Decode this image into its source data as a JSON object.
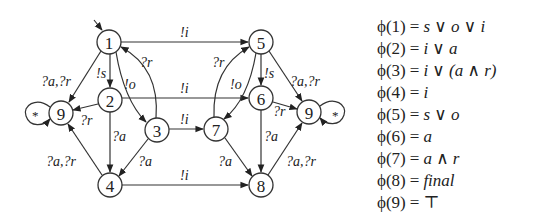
{
  "diagram": {
    "nodes": [
      {
        "id": "1",
        "label": "1",
        "x": 109,
        "y": 42
      },
      {
        "id": "2",
        "label": "2",
        "x": 110,
        "y": 100
      },
      {
        "id": "3",
        "label": "3",
        "x": 157,
        "y": 130
      },
      {
        "id": "4",
        "label": "4",
        "x": 110,
        "y": 185
      },
      {
        "id": "5",
        "label": "5",
        "x": 261,
        "y": 42
      },
      {
        "id": "6",
        "label": "6",
        "x": 261,
        "y": 98
      },
      {
        "id": "7",
        "label": "7",
        "x": 216,
        "y": 129
      },
      {
        "id": "8",
        "label": "8",
        "x": 261,
        "y": 185
      },
      {
        "id": "9L",
        "label": "9",
        "x": 61,
        "y": 113
      },
      {
        "id": "9R",
        "label": "9",
        "x": 309,
        "y": 112
      }
    ],
    "edges": [
      {
        "from": "start",
        "to": "1",
        "label": ""
      },
      {
        "from": "1",
        "to": "5",
        "label": "!i"
      },
      {
        "from": "2",
        "to": "6",
        "label": "!i"
      },
      {
        "from": "3",
        "to": "7",
        "label": "!i"
      },
      {
        "from": "4",
        "to": "8",
        "label": "!i"
      },
      {
        "from": "1",
        "to": "2",
        "label": "!s"
      },
      {
        "from": "1",
        "to": "3",
        "label": "!o"
      },
      {
        "from": "3",
        "to": "1",
        "label": "?r"
      },
      {
        "from": "1",
        "to": "9L",
        "label": "?a,?r"
      },
      {
        "from": "2",
        "to": "9L",
        "label": "?r"
      },
      {
        "from": "2",
        "to": "4",
        "label": "?a"
      },
      {
        "from": "3",
        "to": "4",
        "label": "?a"
      },
      {
        "from": "4",
        "to": "9L",
        "label": "?a,?r"
      },
      {
        "from": "9L",
        "to": "9L",
        "label": "*"
      },
      {
        "from": "5",
        "to": "6",
        "label": "!s"
      },
      {
        "from": "5",
        "to": "7",
        "label": "!o"
      },
      {
        "from": "7",
        "to": "5",
        "label": "?r"
      },
      {
        "from": "5",
        "to": "9R",
        "label": "?a,?r"
      },
      {
        "from": "6",
        "to": "9R",
        "label": "?r"
      },
      {
        "from": "6",
        "to": "8",
        "label": "?a"
      },
      {
        "from": "7",
        "to": "8",
        "label": "?a"
      },
      {
        "from": "8",
        "to": "9R",
        "label": "?a,?r"
      },
      {
        "from": "9R",
        "to": "9R",
        "label": "*"
      }
    ],
    "labels": {
      "e_1_5": "!i",
      "e_2_6": "!i",
      "e_3_7": "!i",
      "e_4_8": "!i",
      "e_1_2": "!s",
      "e_1_3": "!o",
      "e_3_1": "?r",
      "e_1_9": "?a,?r",
      "e_2_9": "?r",
      "e_2_4": "?a",
      "e_3_4": "?a",
      "e_4_9": "?a,?r",
      "loop_9L": "*",
      "e_5_6": "!s",
      "e_5_7": "!o",
      "e_7_5": "?r",
      "e_5_9": "?a,?r",
      "e_6_9": "?r",
      "e_6_8": "?a",
      "e_7_8": "?a",
      "e_8_9": "?a,?r",
      "loop_9R": "*"
    }
  },
  "formulas": [
    {
      "lhs": "ϕ(1)",
      "eq": "=",
      "rhs": "s ∨ o ∨ i"
    },
    {
      "lhs": "ϕ(2)",
      "eq": "=",
      "rhs": "i ∨ a"
    },
    {
      "lhs": "ϕ(3)",
      "eq": "=",
      "rhs": "i ∨ (a ∧ r)"
    },
    {
      "lhs": "ϕ(4)",
      "eq": "=",
      "rhs": "i"
    },
    {
      "lhs": "ϕ(5)",
      "eq": "=",
      "rhs": "s ∨ o"
    },
    {
      "lhs": "ϕ(6)",
      "eq": "=",
      "rhs": "a"
    },
    {
      "lhs": "ϕ(7)",
      "eq": "=",
      "rhs": "a ∧ r"
    },
    {
      "lhs": "ϕ(8)",
      "eq": "=",
      "rhs": "final"
    },
    {
      "lhs": "ϕ(9)",
      "eq": "=",
      "rhs": "⊤"
    }
  ]
}
